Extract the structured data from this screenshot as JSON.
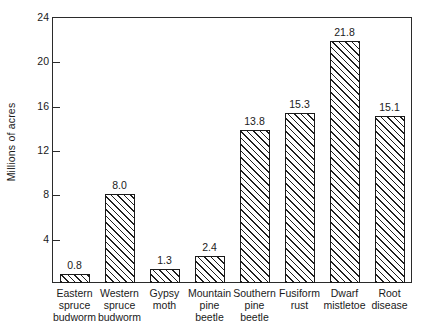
{
  "chart_data": {
    "type": "bar",
    "title": "",
    "xlabel": "",
    "ylabel": "Millions of acres",
    "ylim": [
      0,
      24
    ],
    "yticks": [
      4,
      8,
      12,
      16,
      20,
      24
    ],
    "ytick_labels": [
      "4",
      "8",
      "12",
      "16",
      "20",
      "24"
    ],
    "grid": false,
    "legend": false,
    "categories": [
      "Eastern spruce budworm",
      "Western spruce budworm",
      "Gypsy moth",
      "Mountain pine beetle",
      "Southern pine beetle",
      "Fusiform rust",
      "Dwarf mistletoe",
      "Root disease"
    ],
    "category_lines": [
      [
        "Eastern",
        "spruce",
        "budworm"
      ],
      [
        "Western",
        "spruce",
        "budworm"
      ],
      [
        "Gypsy",
        "moth"
      ],
      [
        "Mountain",
        "pine",
        "beetle"
      ],
      [
        "Southern",
        "pine",
        "beetle"
      ],
      [
        "Fusiform",
        "rust"
      ],
      [
        "Dwarf",
        "mistletoe"
      ],
      [
        "Root",
        "disease"
      ]
    ],
    "values": [
      0.8,
      8.0,
      1.3,
      2.4,
      13.8,
      15.3,
      21.8,
      15.1
    ],
    "value_labels": [
      "0.8",
      "8.0",
      "1.3",
      "2.4",
      "13.8",
      "15.3",
      "21.8",
      "15.1"
    ],
    "bar_style": {
      "fill": "diagonal-hatch",
      "hatch_direction": "forward-slash",
      "edge_color": "#1a1a1a",
      "face_color": "#ffffff"
    },
    "axis_color": "#2b2b2b",
    "background_color": "#ffffff"
  }
}
